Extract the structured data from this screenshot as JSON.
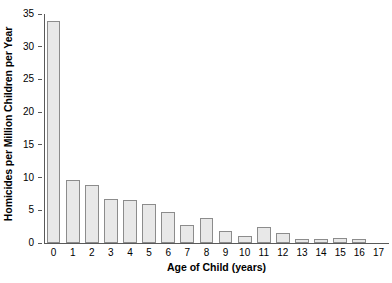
{
  "chart_data": {
    "type": "bar",
    "title": "",
    "xlabel": "Age of Child (years)",
    "ylabel": "Homicides per Million Children per Year",
    "categories": [
      "0",
      "1",
      "2",
      "3",
      "4",
      "5",
      "6",
      "7",
      "8",
      "9",
      "10",
      "11",
      "12",
      "13",
      "14",
      "15",
      "16",
      "17"
    ],
    "values": [
      34,
      9.6,
      8.9,
      6.7,
      6.6,
      5.9,
      4.7,
      2.7,
      3.8,
      1.9,
      1.0,
      2.4,
      1.6,
      0.6,
      0.6,
      0.8,
      0.6,
      0
    ],
    "ylim": [
      0,
      35
    ],
    "yticks": [
      0,
      5,
      10,
      15,
      20,
      25,
      30,
      35
    ],
    "yticklabels": [
      "0",
      "5",
      "10",
      "15",
      "20",
      "25",
      "30",
      "35"
    ],
    "xlim": [
      -0.5,
      17.5
    ],
    "grid": false,
    "legend": null,
    "bar_fill_color": "#e8e8e8",
    "bar_edge_color": "#8c8c8c",
    "axis_color": "#595959"
  }
}
